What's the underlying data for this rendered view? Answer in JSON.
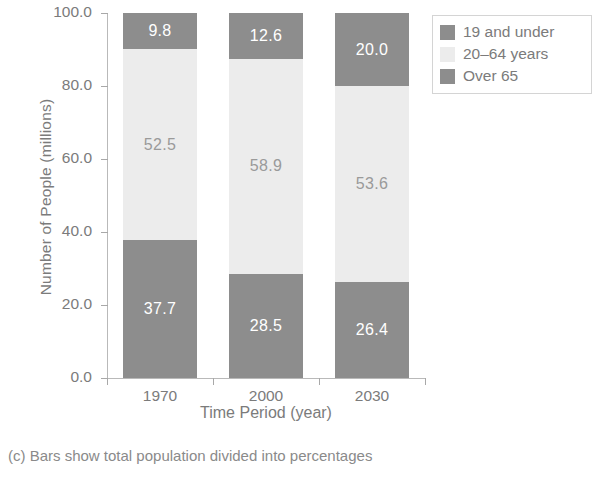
{
  "chart_data": {
    "type": "bar",
    "subtype": "stacked-bar",
    "title": "",
    "xlabel": "Time Period (year)",
    "ylabel": "Number of People (millions)",
    "categories": [
      "1970",
      "2000",
      "2030"
    ],
    "ylim": [
      0,
      100
    ],
    "yticks": [
      "0.0",
      "20.0",
      "40.0",
      "60.0",
      "80.0",
      "100.0"
    ],
    "ytick_values": [
      0,
      20,
      40,
      60,
      80,
      100
    ],
    "grid": false,
    "legend_position": "upper right",
    "stack_order_bottom_to_top": [
      "19 and under",
      "20–64 years",
      "Over 65"
    ],
    "series": [
      {
        "name": "19 and under",
        "values": [
          37.7,
          28.5,
          26.4
        ],
        "labels": [
          "37.7",
          "28.5",
          "26.4"
        ],
        "color": "#8d8d8d",
        "label_color": "#ffffff"
      },
      {
        "name": "20–64 years",
        "values": [
          52.5,
          58.9,
          53.6
        ],
        "labels": [
          "52.5",
          "58.9",
          "53.6"
        ],
        "color": "#ececec",
        "label_color": "#9a9a9a"
      },
      {
        "name": "Over 65",
        "values": [
          9.8,
          12.6,
          20.0
        ],
        "labels": [
          "9.8",
          "12.6",
          "20.0"
        ],
        "color": "#8d8d8d",
        "label_color": "#ffffff"
      }
    ],
    "totals": [
      100.0,
      100.0,
      100.0
    ]
  },
  "legend": {
    "items": [
      {
        "label": "19 and under",
        "color": "#8d8d8d"
      },
      {
        "label": "20–64 years",
        "color": "#ececec"
      },
      {
        "label": "Over 65",
        "color": "#8d8d8d"
      }
    ]
  },
  "caption": {
    "text": "(c) Bars show total population divided into percentages"
  },
  "colors": {
    "dark_segment": "#8d8d8d",
    "light_segment": "#ececec",
    "axis": "#b9b9b9",
    "text": "#7b7b7b",
    "legend_border": "#d4d4d4"
  }
}
